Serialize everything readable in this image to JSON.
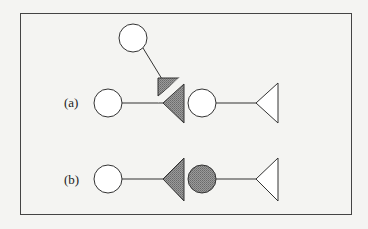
{
  "diagram": {
    "labels": {
      "a": "(a)",
      "b": "(b)"
    },
    "colors": {
      "background": "#f4f4f2",
      "stroke": "#333333",
      "hatch_fill": "#8a8a8a",
      "hatch_line": "#555555",
      "open_fill": "#ffffff"
    },
    "panel_a": {
      "description": "Three-part chain: upper circle linked diagonally to a small hatched triangle; left circle linked to large hatched triangle, split by a white diagonal gap; then a circle linked to an open triangle",
      "shapes": [
        "open-circle-top",
        "hatched-small-triangle",
        "open-circle-left",
        "hatched-large-triangle",
        "open-circle-middle",
        "open-triangle-right"
      ]
    },
    "panel_b": {
      "description": "Open circle linked to a hatched triangle, adjacent hatched circle linked to an open triangle",
      "shapes": [
        "open-circle-left",
        "hatched-triangle",
        "hatched-circle",
        "open-triangle-right"
      ]
    }
  }
}
